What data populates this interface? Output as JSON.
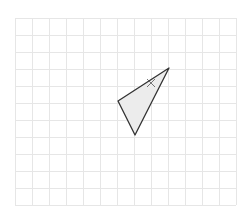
{
  "diagram": {
    "type": "geometry-grid",
    "background": "#ffffff",
    "grid": {
      "x0": 15,
      "y0": 18,
      "cell": 17,
      "cols": 13,
      "rows": 11,
      "line_color": "#e6e6e6"
    },
    "triangle": {
      "vertices": [
        [
          169,
          68
        ],
        [
          118,
          101
        ],
        [
          135,
          135
        ]
      ],
      "fill": "#ececec",
      "stroke": "#333333"
    },
    "tick_mark": {
      "center": [
        151,
        83
      ],
      "size": 4,
      "color": "#555555"
    }
  }
}
